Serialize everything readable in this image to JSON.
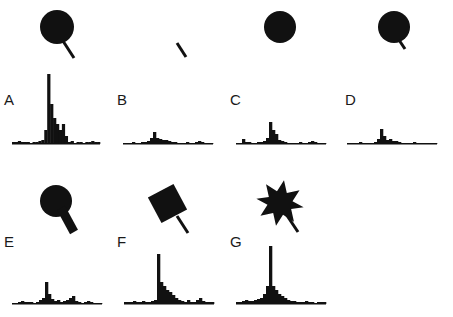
{
  "figure": {
    "panels": [
      {
        "id": "A",
        "label": "A",
        "stimulus": "circle-with-stick",
        "hist": [
          2,
          2,
          3,
          2,
          2,
          2,
          1,
          2,
          2,
          3,
          4,
          14,
          70,
          40,
          26,
          20,
          14,
          20,
          8,
          2,
          3,
          1,
          2,
          2,
          1,
          2,
          2,
          3,
          2,
          2
        ]
      },
      {
        "id": "B",
        "label": "B",
        "stimulus": "stick-only",
        "hist": [
          1,
          1,
          1,
          2,
          1,
          1,
          2,
          2,
          3,
          6,
          12,
          6,
          5,
          4,
          4,
          3,
          2,
          2,
          1,
          1,
          1,
          2,
          1,
          1,
          2,
          3,
          2,
          1,
          1,
          1
        ]
      },
      {
        "id": "C",
        "label": "C",
        "stimulus": "circle-only",
        "hist": [
          1,
          1,
          5,
          2,
          2,
          1,
          1,
          2,
          2,
          3,
          6,
          22,
          14,
          10,
          4,
          3,
          2,
          1,
          1,
          1,
          1,
          2,
          1,
          1,
          2,
          3,
          2,
          1,
          1,
          1
        ]
      },
      {
        "id": "D",
        "label": "D",
        "stimulus": "circle-with-short-stick",
        "hist": [
          1,
          1,
          1,
          1,
          2,
          1,
          1,
          1,
          1,
          2,
          5,
          15,
          8,
          4,
          5,
          3,
          3,
          2,
          1,
          1,
          1,
          1,
          2,
          1,
          1,
          1,
          1,
          1,
          1,
          1
        ]
      },
      {
        "id": "E",
        "label": "E",
        "stimulus": "circle-with-thick-stub",
        "hist": [
          1,
          1,
          2,
          3,
          2,
          2,
          2,
          1,
          2,
          4,
          6,
          22,
          10,
          5,
          3,
          4,
          2,
          3,
          4,
          6,
          8,
          3,
          2,
          1,
          2,
          3,
          2,
          1,
          1,
          1
        ]
      },
      {
        "id": "F",
        "label": "F",
        "stimulus": "square-with-stick",
        "hist": [
          2,
          2,
          2,
          3,
          2,
          2,
          3,
          2,
          2,
          3,
          4,
          50,
          22,
          18,
          14,
          12,
          9,
          6,
          4,
          3,
          2,
          4,
          2,
          2,
          4,
          6,
          3,
          2,
          2,
          2
        ]
      },
      {
        "id": "G",
        "label": "G",
        "stimulus": "star-with-stick",
        "hist": [
          2,
          2,
          3,
          4,
          3,
          3,
          4,
          5,
          6,
          10,
          18,
          58,
          18,
          14,
          10,
          8,
          6,
          4,
          3,
          3,
          2,
          2,
          2,
          3,
          2,
          2,
          1,
          2,
          2,
          2
        ]
      }
    ]
  },
  "colors": {
    "ink": "#111111",
    "background": "#ffffff"
  }
}
